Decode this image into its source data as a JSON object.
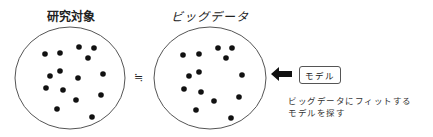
{
  "left_panel": {
    "title": "研究対象",
    "dots": [
      [
        45,
        54
      ],
      [
        60,
        53
      ],
      [
        79,
        47
      ],
      [
        94,
        48
      ],
      [
        88,
        58
      ],
      [
        60,
        71
      ],
      [
        50,
        76
      ],
      [
        78,
        78
      ],
      [
        103,
        74
      ],
      [
        46,
        88
      ],
      [
        63,
        90
      ],
      [
        76,
        100
      ],
      [
        101,
        95
      ],
      [
        57,
        109
      ],
      [
        92,
        117
      ]
    ]
  },
  "relation_symbol": "≒",
  "right_panel": {
    "title": "ビッグデータ",
    "dots": [
      [
        183,
        55
      ],
      [
        199,
        54
      ],
      [
        218,
        48
      ],
      [
        232,
        48
      ],
      [
        226,
        58
      ],
      [
        199,
        72
      ],
      [
        189,
        76
      ],
      [
        242,
        75
      ],
      [
        184,
        89
      ],
      [
        201,
        92
      ],
      [
        239,
        97
      ],
      [
        214,
        101
      ],
      [
        196,
        110
      ],
      [
        231,
        118
      ]
    ]
  },
  "model_box": {
    "label": "モデル"
  },
  "caption": {
    "line1": "ビッグデータにフィットする",
    "line2": "モデルを探す"
  },
  "arrow": {
    "direction": "left",
    "color": "#111111"
  }
}
